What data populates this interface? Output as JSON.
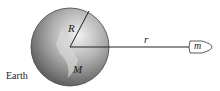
{
  "diagram": {
    "earth_label": "Earth",
    "radius_label": "R",
    "mass_label": "M",
    "distance_label": "r",
    "satellite_label": "m",
    "colors": {
      "earth_light": "#e8e8e8",
      "earth_dark": "#555555",
      "line": "#333333"
    }
  }
}
